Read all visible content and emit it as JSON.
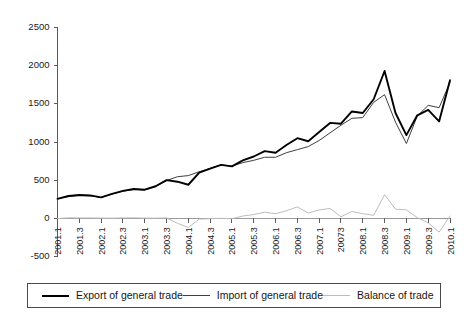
{
  "chart_data": {
    "type": "line",
    "title": "",
    "xlabel": "",
    "ylabel": "",
    "ylim": [
      -500,
      2500
    ],
    "ytick_values": [
      2500,
      2000,
      1500,
      1000,
      500,
      0,
      -500
    ],
    "ytick_labels": [
      "2500",
      "2000",
      "1500",
      "1000",
      "500",
      "0",
      "-500"
    ],
    "grid": false,
    "legend_position": "bottom",
    "x": [
      "2001.1",
      "2001.2",
      "2001.3",
      "2001.4",
      "2002.1",
      "2002.2",
      "2002.3",
      "2002.4",
      "2003.1",
      "2003.2",
      "2003.3",
      "2003.4",
      "2004.1",
      "2004.2",
      "2004.3",
      "2004.4",
      "2005.1",
      "2005.2",
      "2005.3",
      "2005.4",
      "2006.1",
      "2006.2",
      "2006.3",
      "2006.4",
      "2007.1",
      "2007.2",
      "2007.3",
      "2007.4",
      "2008.1",
      "2008.2",
      "2008.3",
      "2008.4",
      "2009.1",
      "2009.2",
      "2009.3",
      "2009.4",
      "2010.1"
    ],
    "xtick_labels": [
      "2001.1",
      "2001.3",
      "2002.1",
      "2002.3",
      "2003.1",
      "2003.3",
      "2004.1",
      "2004.3",
      "2005.1",
      "2005.3",
      "2006.1",
      "2006.3",
      "2007.1",
      "20073",
      "2008.1",
      "2008.3",
      "2009.1",
      "2009.3",
      "2010.1"
    ],
    "xtick_indices": [
      0,
      2,
      4,
      6,
      8,
      10,
      12,
      14,
      16,
      18,
      20,
      22,
      24,
      26,
      28,
      30,
      32,
      34,
      36
    ],
    "series": [
      {
        "name": "Export of general trade",
        "color": "#000000",
        "values": [
          255,
          292,
          305,
          300,
          275,
          320,
          360,
          385,
          375,
          420,
          500,
          480,
          440,
          600,
          650,
          700,
          680,
          760,
          810,
          880,
          860,
          960,
          1050,
          1010,
          1130,
          1250,
          1240,
          1400,
          1380,
          1560,
          1930,
          1380,
          1090,
          1350,
          1420,
          1270,
          1810
        ]
      },
      {
        "name": "Import of general trade",
        "color": "#3f3f3f",
        "values": [
          258,
          285,
          300,
          295,
          272,
          318,
          355,
          378,
          372,
          418,
          495,
          545,
          560,
          610,
          655,
          700,
          685,
          730,
          760,
          800,
          800,
          860,
          900,
          940,
          1020,
          1120,
          1220,
          1310,
          1320,
          1520,
          1620,
          1260,
          980,
          1340,
          1480,
          1450,
          1780
        ]
      },
      {
        "name": "Balance of trade",
        "color": "#bdbdbd",
        "values": [
          -3,
          7,
          5,
          5,
          3,
          2,
          5,
          7,
          3,
          2,
          5,
          -65,
          -120,
          -10,
          -5,
          0,
          -5,
          30,
          50,
          80,
          60,
          100,
          150,
          70,
          110,
          130,
          20,
          90,
          60,
          40,
          310,
          120,
          110,
          10,
          -60,
          -180,
          30
        ]
      }
    ],
    "legend": [
      {
        "label": "Export of general trade",
        "swatch": "line-swatch-export"
      },
      {
        "label": "Import of general trade",
        "swatch": "line-swatch-import"
      },
      {
        "label": "Balance of trade",
        "swatch": "line-swatch-balance"
      }
    ]
  }
}
